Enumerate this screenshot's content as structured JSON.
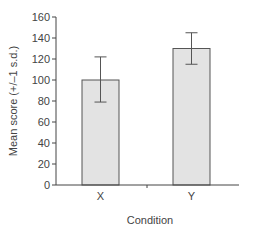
{
  "chart_data": {
    "type": "bar",
    "title": "",
    "xlabel": "Condition",
    "ylabel": "Mean score (+/–1 s.d.)",
    "categories": [
      "X",
      "Y"
    ],
    "values": [
      100,
      130
    ],
    "error_bars": {
      "type": "+/-1 s.d.",
      "upper": [
        122,
        145
      ],
      "lower": [
        79,
        115
      ]
    },
    "ylim": [
      0,
      160
    ],
    "yticks": [
      0,
      20,
      40,
      60,
      80,
      100,
      120,
      140,
      160
    ],
    "grid": false,
    "legend": null,
    "colors": {
      "bar_fill": "#e3e3e3",
      "bar_edge": "#555555",
      "axis": "#444444",
      "error_bar": "#555555"
    }
  }
}
